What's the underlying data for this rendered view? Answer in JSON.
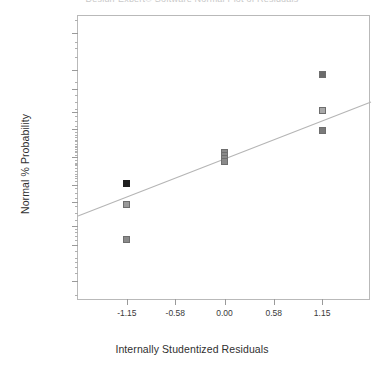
{
  "figure": {
    "clipped_top_text": "Design-Expert® Software    Normal Plot of Residuals",
    "background_color": "#ffffff"
  },
  "axes": {
    "frame_color": "#b9b9b9",
    "tick_color": "#9a9a9a"
  },
  "chart_data": {
    "type": "scatter",
    "title": "",
    "xlabel": "Internally Studentized Residuals",
    "ylabel": "Normal % Probability",
    "xlim": [
      -1.7255,
      1.7255
    ],
    "xticks": [
      -1.15,
      -0.58,
      0.0,
      0.58,
      1.15
    ],
    "xticklabels": [
      "-1.15",
      "-0.58",
      "0.00",
      "0.58",
      "1.15"
    ],
    "yticks": [
      1,
      5,
      10,
      20,
      30,
      50,
      70,
      80,
      90,
      95,
      99
    ],
    "yticklabels": [
      "1",
      "5",
      "10",
      "20",
      "30",
      "50",
      "70",
      "80",
      "90",
      "95",
      "99"
    ],
    "ylim": [
      0.2,
      99.9
    ],
    "y_scale": "probability",
    "grid": false,
    "legend": false,
    "marker": "square",
    "series": [
      {
        "name": "Residuals",
        "points": [
          {
            "x": -1.15,
            "y": 31.0,
            "color": "#1f1f1f"
          },
          {
            "x": -1.15,
            "y": 19.0,
            "color": "#9a9a9a"
          },
          {
            "x": -1.15,
            "y": 6.2,
            "color": "#8a8a8a"
          },
          {
            "x": 0.0,
            "y": 53.5,
            "color": "#8a8a8a"
          },
          {
            "x": 0.0,
            "y": 51.0,
            "color": "#8a8a8a"
          },
          {
            "x": 0.0,
            "y": 49.0,
            "color": "#8a8a8a"
          },
          {
            "x": 0.0,
            "y": 46.5,
            "color": "#8a8a8a"
          },
          {
            "x": 1.15,
            "y": 94.0,
            "color": "#6b6b6b"
          },
          {
            "x": 1.15,
            "y": 81.0,
            "color": "#a8a8a8"
          },
          {
            "x": 1.15,
            "y": 69.5,
            "color": "#7a7a7a"
          }
        ]
      }
    ],
    "reference_line": {
      "name": "Normal reference line",
      "color": "#b5b5b5",
      "x_start": -1.7255,
      "y_start": 13.5,
      "x_end": 1.7255,
      "y_end": 85.0
    }
  }
}
